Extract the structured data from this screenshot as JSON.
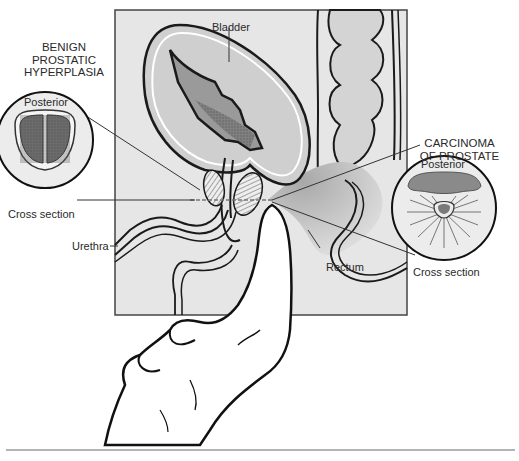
{
  "figure": {
    "colors": {
      "panel_bg": "#e6e6e6",
      "outline": "#1a1a1a",
      "organ_fill": "#c8c8c8",
      "dark_fill": "#8e8e8e",
      "skin": "#ffffff",
      "rule": "#9a9a9a"
    }
  },
  "labels": {
    "bladder": "Bladder",
    "urethra": "Urethra",
    "rectum": "Rectum"
  },
  "left_inset": {
    "title_lines": [
      "BENIGN",
      "PROSTATIC",
      "HYPERPLASIA"
    ],
    "orientation": "Posterior",
    "caption": "Cross section"
  },
  "right_inset": {
    "title_lines": [
      "CARCINOMA",
      "OF PROSTATE"
    ],
    "orientation": "Posterior",
    "caption": "Cross section"
  }
}
